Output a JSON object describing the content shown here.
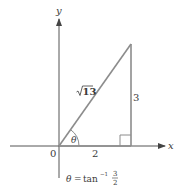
{
  "diagram": {
    "type": "right-triangle-on-axes",
    "axes": {
      "x_label": "x",
      "y_label": "y",
      "origin_label": "0",
      "axis_color": "#555555"
    },
    "triangle": {
      "line_color": "#8c8c8c",
      "hypotenuse_label": "√13",
      "hypotenuse_radicand": "13",
      "adjacent_label": "2",
      "opposite_label": "3",
      "angle_label": "θ",
      "right_angle_marker": true
    },
    "formula": {
      "lhs": "θ",
      "equals": "=",
      "func": "tan",
      "exponent": "−1",
      "numerator": "3",
      "denominator": "2"
    }
  }
}
